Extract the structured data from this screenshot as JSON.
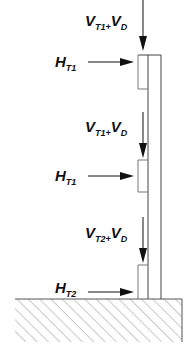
{
  "diagram": {
    "colors": {
      "stroke": "#111111",
      "wall": "#444444",
      "hatch": "#888888",
      "background": "#ffffff"
    },
    "loads": [
      {
        "type": "vertical",
        "main1": "V",
        "sub1": "T1",
        "plus": "+",
        "main2": "V",
        "sub2": "D"
      },
      {
        "type": "horizontal",
        "main": "H",
        "sub": "T1"
      },
      {
        "type": "vertical",
        "main1": "V",
        "sub1": "T1",
        "plus": "+",
        "main2": "V",
        "sub2": "D"
      },
      {
        "type": "horizontal",
        "main": "H",
        "sub": "T1"
      },
      {
        "type": "vertical",
        "main1": "V",
        "sub1": "T2",
        "plus": "+",
        "main2": "V",
        "sub2": "D"
      },
      {
        "type": "horizontal",
        "main": "H",
        "sub": "T2"
      }
    ]
  }
}
